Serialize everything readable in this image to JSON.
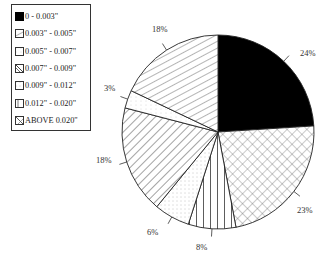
{
  "chart_data": {
    "type": "pie",
    "title": "",
    "start_angle": "12 o'clock, clockwise",
    "legend_position": "upper-left",
    "categories": [
      "0 - 0.003\"",
      "0.003\" - 0.005\"",
      "0.005\" - 0.007\"",
      "0.007\" - 0.009\"",
      "0.009\" - 0.012\"",
      "0.012\" - 0.020\"",
      "ABOVE 0.020\""
    ],
    "values": [
      24,
      18,
      3,
      18,
      6,
      8,
      23
    ],
    "units": "%",
    "slices_clockwise_from_top": [
      {
        "label": "0 - 0.003\"",
        "value": 24,
        "pattern": "solid-black"
      },
      {
        "label": "ABOVE 0.020\"",
        "value": 23,
        "pattern": "crosshatch"
      },
      {
        "label": "0.012\" - 0.020\"",
        "value": 8,
        "pattern": "vertical-lines"
      },
      {
        "label": "0.009\" - 0.012\"",
        "value": 6,
        "pattern": "dots"
      },
      {
        "label": "0.007\" - 0.009\"",
        "value": 18,
        "pattern": "back-diagonal"
      },
      {
        "label": "0.005\" - 0.007\"",
        "value": 3,
        "pattern": "light-dots"
      },
      {
        "label": "0.003\" - 0.005\"",
        "value": 18,
        "pattern": "forward-diagonal"
      }
    ]
  },
  "legend": {
    "items": [
      {
        "label": "0 - 0.003\"",
        "pattern": "solid-black"
      },
      {
        "label": "0.003\" - 0.005\"",
        "pattern": "forward-diagonal"
      },
      {
        "label": "0.005\" - 0.007\"",
        "pattern": "light-dots"
      },
      {
        "label": "0.007\" - 0.009\"",
        "pattern": "back-diagonal"
      },
      {
        "label": "0.009\" - 0.012\"",
        "pattern": "dots"
      },
      {
        "label": "0.012\" - 0.020\"",
        "pattern": "vertical-lines"
      },
      {
        "label": "ABOVE 0.020\"",
        "pattern": "crosshatch"
      }
    ]
  },
  "labels": {
    "s24": "24%",
    "s23": "23%",
    "s8": "8%",
    "s6": "6%",
    "s18a": "18%",
    "s3": "3%",
    "s18b": "18%"
  }
}
